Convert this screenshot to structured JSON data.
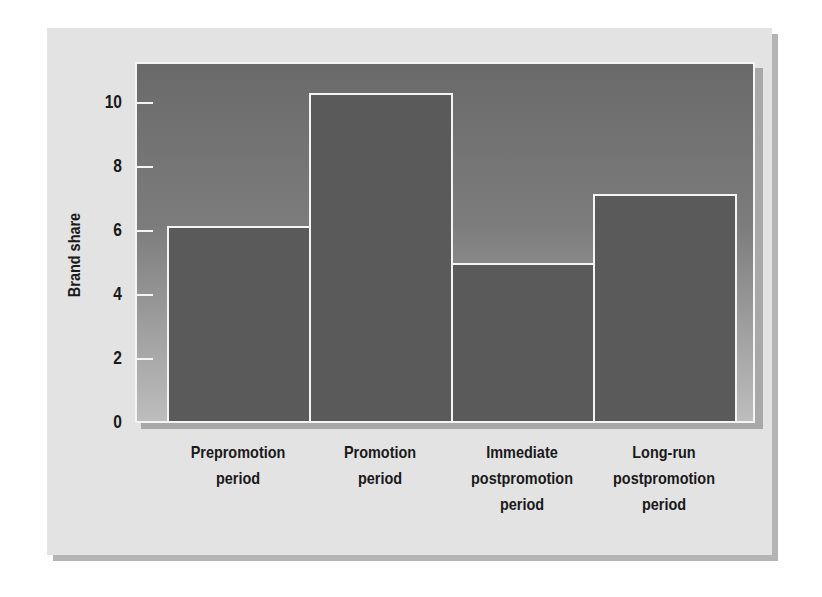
{
  "chart_data": {
    "type": "bar",
    "title": "",
    "xlabel": "",
    "ylabel": "Brand share",
    "categories": [
      [
        "Prepromotion",
        "period"
      ],
      [
        "Promotion",
        "period"
      ],
      [
        "Immediate",
        "postpromotion",
        "period"
      ],
      [
        "Long-run",
        "postpromotion",
        "period"
      ]
    ],
    "category_names": [
      "Prepromotion period",
      "Promotion period",
      "Immediate postpromotion period",
      "Long-run postpromotion period"
    ],
    "values": [
      6.1,
      10.25,
      4.95,
      7.1
    ],
    "ylim": [
      0,
      11.2
    ],
    "yticks": [
      0,
      2,
      4,
      6,
      8,
      10
    ],
    "ytick_labels": [
      "0",
      "2",
      "4",
      "6",
      "8",
      "10"
    ],
    "grid": false,
    "legend": null
  },
  "colors": {
    "panel": "#e3e3e3",
    "plot_top": "#6a6a6a",
    "plot_bottom": "#bdbdbd",
    "bar": "#5a5a5a",
    "outline": "#f4f4f4",
    "text": "#1a1a1a"
  }
}
